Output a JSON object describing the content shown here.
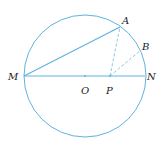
{
  "diagram": {
    "type": "geometry-circle",
    "colors": {
      "line": "#5fb3e0",
      "dashed": "#8cc8e8",
      "text": "#222222"
    },
    "points": {
      "M": {
        "label": "M",
        "x": 24,
        "y": 76
      },
      "N": {
        "label": "N",
        "x": 145,
        "y": 76
      },
      "O": {
        "label": "O",
        "x": 85,
        "y": 76
      },
      "P": {
        "label": "P",
        "x": 110,
        "y": 76
      },
      "A": {
        "label": "A",
        "x": 120,
        "y": 27
      },
      "B": {
        "label": "B",
        "x": 141,
        "y": 50
      }
    },
    "circle": {
      "center": "O",
      "radius": 61
    },
    "segments": [
      {
        "from": "M",
        "to": "N",
        "style": "solid"
      },
      {
        "from": "M",
        "to": "A",
        "style": "solid"
      },
      {
        "from": "P",
        "to": "A",
        "style": "dashed"
      },
      {
        "from": "P",
        "to": "B",
        "style": "dashed"
      }
    ]
  }
}
